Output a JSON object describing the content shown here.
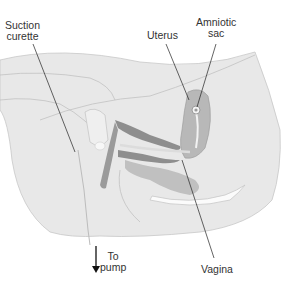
{
  "diagram": {
    "type": "anatomical-illustration",
    "labels": {
      "suction_curette": [
        "Suction",
        "curette"
      ],
      "uterus": "Uterus",
      "amniotic_sac": [
        "Amniotic",
        "sac"
      ],
      "to_pump": [
        "To",
        "pump"
      ],
      "vagina": "Vagina"
    },
    "colors": {
      "body": "#e6e6e6",
      "body_outline": "#bdbdbd",
      "tissue_dark": "#a9a9a9",
      "uterus": "#b9b9b9",
      "instrument": "#8f8f8f",
      "leader_line": "#222222",
      "text": "#333333"
    }
  }
}
